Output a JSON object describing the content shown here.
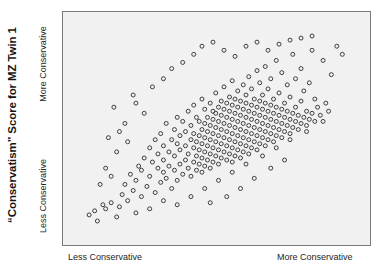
{
  "chart_data": {
    "type": "scatter",
    "title": "“Conservatism” Score for MZ Twin 1",
    "xlabel": "",
    "ylabel": "“Conservatism” Score for MZ Twin 1",
    "x_tick_labels": [
      "Less Conservative",
      "More Conservative"
    ],
    "y_tick_labels": [
      "Less Conservative",
      "More Conservative"
    ],
    "legend": [],
    "grid": false,
    "xlim": [
      0,
      100
    ],
    "ylim": [
      0,
      100
    ],
    "marker": "open-circle",
    "marker_color": "#3c3c3c",
    "marker_fill": "none",
    "marker_size": 4,
    "n_points": 312,
    "correlation_note": "strong positive correlation",
    "points": [
      [
        3,
        7
      ],
      [
        5,
        9
      ],
      [
        6,
        4
      ],
      [
        8,
        12
      ],
      [
        9,
        10
      ],
      [
        11,
        13
      ],
      [
        13,
        6
      ],
      [
        14,
        11
      ],
      [
        15,
        17
      ],
      [
        16,
        22
      ],
      [
        17,
        14
      ],
      [
        18,
        27
      ],
      [
        19,
        19
      ],
      [
        20,
        24
      ],
      [
        21,
        31
      ],
      [
        22,
        16
      ],
      [
        22,
        29
      ],
      [
        23,
        35
      ],
      [
        24,
        21
      ],
      [
        25,
        26
      ],
      [
        25,
        40
      ],
      [
        26,
        33
      ],
      [
        27,
        18
      ],
      [
        27,
        44
      ],
      [
        28,
        30
      ],
      [
        28,
        37
      ],
      [
        29,
        23
      ],
      [
        29,
        47
      ],
      [
        30,
        28
      ],
      [
        30,
        34
      ],
      [
        30,
        41
      ],
      [
        31,
        25
      ],
      [
        31,
        52
      ],
      [
        32,
        31
      ],
      [
        32,
        38
      ],
      [
        33,
        20
      ],
      [
        33,
        44
      ],
      [
        34,
        29
      ],
      [
        34,
        36
      ],
      [
        34,
        49
      ],
      [
        35,
        24
      ],
      [
        35,
        42
      ],
      [
        35,
        55
      ],
      [
        36,
        32
      ],
      [
        36,
        39
      ],
      [
        36,
        46
      ],
      [
        37,
        27
      ],
      [
        37,
        53
      ],
      [
        38,
        34
      ],
      [
        38,
        41
      ],
      [
        38,
        48
      ],
      [
        39,
        30
      ],
      [
        39,
        37
      ],
      [
        39,
        58
      ],
      [
        40,
        26
      ],
      [
        40,
        44
      ],
      [
        40,
        51
      ],
      [
        41,
        33
      ],
      [
        41,
        40
      ],
      [
        41,
        47
      ],
      [
        41,
        61
      ],
      [
        42,
        29
      ],
      [
        42,
        36
      ],
      [
        42,
        43
      ],
      [
        42,
        55
      ],
      [
        43,
        32
      ],
      [
        43,
        39
      ],
      [
        43,
        46
      ],
      [
        43,
        53
      ],
      [
        44,
        28
      ],
      [
        44,
        35
      ],
      [
        44,
        42
      ],
      [
        44,
        49
      ],
      [
        44,
        64
      ],
      [
        45,
        31
      ],
      [
        45,
        38
      ],
      [
        45,
        45
      ],
      [
        45,
        52
      ],
      [
        45,
        59
      ],
      [
        46,
        34
      ],
      [
        46,
        41
      ],
      [
        46,
        48
      ],
      [
        46,
        55
      ],
      [
        47,
        30
      ],
      [
        47,
        37
      ],
      [
        47,
        44
      ],
      [
        47,
        51
      ],
      [
        47,
        62
      ],
      [
        48,
        33
      ],
      [
        48,
        40
      ],
      [
        48,
        47
      ],
      [
        48,
        54
      ],
      [
        48,
        58
      ],
      [
        49,
        36
      ],
      [
        49,
        43
      ],
      [
        49,
        50
      ],
      [
        49,
        57
      ],
      [
        49,
        67
      ],
      [
        50,
        32
      ],
      [
        50,
        39
      ],
      [
        50,
        46
      ],
      [
        50,
        53
      ],
      [
        50,
        60
      ],
      [
        51,
        35
      ],
      [
        51,
        42
      ],
      [
        51,
        49
      ],
      [
        51,
        56
      ],
      [
        51,
        63
      ],
      [
        52,
        38
      ],
      [
        52,
        45
      ],
      [
        52,
        52
      ],
      [
        52,
        59
      ],
      [
        52,
        70
      ],
      [
        53,
        34
      ],
      [
        53,
        41
      ],
      [
        53,
        48
      ],
      [
        53,
        55
      ],
      [
        53,
        62
      ],
      [
        54,
        37
      ],
      [
        54,
        44
      ],
      [
        54,
        51
      ],
      [
        54,
        58
      ],
      [
        54,
        65
      ],
      [
        55,
        33
      ],
      [
        55,
        40
      ],
      [
        55,
        47
      ],
      [
        55,
        54
      ],
      [
        55,
        61
      ],
      [
        55,
        73
      ],
      [
        56,
        36
      ],
      [
        56,
        43
      ],
      [
        56,
        50
      ],
      [
        56,
        57
      ],
      [
        56,
        64
      ],
      [
        57,
        39
      ],
      [
        57,
        46
      ],
      [
        57,
        53
      ],
      [
        57,
        60
      ],
      [
        57,
        68
      ],
      [
        58,
        35
      ],
      [
        58,
        42
      ],
      [
        58,
        49
      ],
      [
        58,
        56
      ],
      [
        58,
        63
      ],
      [
        59,
        38
      ],
      [
        59,
        45
      ],
      [
        59,
        52
      ],
      [
        59,
        59
      ],
      [
        59,
        71
      ],
      [
        60,
        41
      ],
      [
        60,
        48
      ],
      [
        60,
        55
      ],
      [
        60,
        62
      ],
      [
        60,
        66
      ],
      [
        61,
        37
      ],
      [
        61,
        44
      ],
      [
        61,
        51
      ],
      [
        61,
        58
      ],
      [
        61,
        75
      ],
      [
        62,
        40
      ],
      [
        62,
        47
      ],
      [
        62,
        54
      ],
      [
        62,
        61
      ],
      [
        62,
        69
      ],
      [
        63,
        43
      ],
      [
        63,
        50
      ],
      [
        63,
        57
      ],
      [
        63,
        64
      ],
      [
        64,
        39
      ],
      [
        64,
        46
      ],
      [
        64,
        53
      ],
      [
        64,
        60
      ],
      [
        64,
        78
      ],
      [
        65,
        42
      ],
      [
        65,
        49
      ],
      [
        65,
        56
      ],
      [
        65,
        63
      ],
      [
        65,
        72
      ],
      [
        66,
        45
      ],
      [
        66,
        52
      ],
      [
        66,
        59
      ],
      [
        66,
        66
      ],
      [
        67,
        41
      ],
      [
        67,
        48
      ],
      [
        67,
        55
      ],
      [
        67,
        62
      ],
      [
        67,
        80
      ],
      [
        68,
        44
      ],
      [
        68,
        51
      ],
      [
        68,
        58
      ],
      [
        68,
        69
      ],
      [
        69,
        47
      ],
      [
        69,
        54
      ],
      [
        69,
        61
      ],
      [
        69,
        74
      ],
      [
        70,
        43
      ],
      [
        70,
        50
      ],
      [
        70,
        57
      ],
      [
        70,
        64
      ],
      [
        71,
        46
      ],
      [
        71,
        53
      ],
      [
        71,
        60
      ],
      [
        71,
        83
      ],
      [
        72,
        49
      ],
      [
        72,
        56
      ],
      [
        72,
        67
      ],
      [
        73,
        45
      ],
      [
        73,
        52
      ],
      [
        73,
        59
      ],
      [
        73,
        77
      ],
      [
        74,
        48
      ],
      [
        74,
        55
      ],
      [
        74,
        62
      ],
      [
        75,
        51
      ],
      [
        75,
        58
      ],
      [
        75,
        71
      ],
      [
        76,
        47
      ],
      [
        76,
        54
      ],
      [
        76,
        65
      ],
      [
        77,
        50
      ],
      [
        77,
        57
      ],
      [
        77,
        86
      ],
      [
        78,
        53
      ],
      [
        78,
        60
      ],
      [
        78,
        74
      ],
      [
        79,
        49
      ],
      [
        79,
        56
      ],
      [
        80,
        52
      ],
      [
        80,
        63
      ],
      [
        80,
        79
      ],
      [
        81,
        55
      ],
      [
        81,
        68
      ],
      [
        82,
        51
      ],
      [
        82,
        58
      ],
      [
        83,
        54
      ],
      [
        83,
        72
      ],
      [
        84,
        57
      ],
      [
        84,
        88
      ],
      [
        85,
        53
      ],
      [
        85,
        64
      ],
      [
        86,
        60
      ],
      [
        87,
        56
      ],
      [
        88,
        83
      ],
      [
        89,
        62
      ],
      [
        90,
        58
      ],
      [
        91,
        76
      ],
      [
        93,
        90
      ],
      [
        95,
        86
      ],
      [
        12,
        60
      ],
      [
        16,
        52
      ],
      [
        19,
        66
      ],
      [
        23,
        57
      ],
      [
        10,
        45
      ],
      [
        13,
        38
      ],
      [
        9,
        30
      ],
      [
        7,
        22
      ],
      [
        11,
        26
      ],
      [
        14,
        48
      ],
      [
        17,
        43
      ],
      [
        20,
        62
      ],
      [
        26,
        70
      ],
      [
        30,
        74
      ],
      [
        33,
        79
      ],
      [
        37,
        82
      ],
      [
        41,
        86
      ],
      [
        44,
        90
      ],
      [
        48,
        92
      ],
      [
        52,
        88
      ],
      [
        56,
        85
      ],
      [
        60,
        90
      ],
      [
        64,
        92
      ],
      [
        68,
        88
      ],
      [
        72,
        91
      ],
      [
        76,
        93
      ],
      [
        80,
        94
      ],
      [
        84,
        95
      ],
      [
        35,
        12
      ],
      [
        40,
        16
      ],
      [
        45,
        20
      ],
      [
        50,
        24
      ],
      [
        55,
        28
      ],
      [
        60,
        32
      ],
      [
        66,
        36
      ],
      [
        71,
        40
      ],
      [
        76,
        44
      ],
      [
        82,
        48
      ],
      [
        88,
        53
      ],
      [
        25,
        10
      ],
      [
        30,
        14
      ],
      [
        20,
        8
      ],
      [
        63,
        25
      ],
      [
        69,
        30
      ],
      [
        74,
        34
      ],
      [
        58,
        20
      ],
      [
        53,
        16
      ],
      [
        47,
        13
      ]
    ]
  },
  "axis": {
    "x_left_label": "Less Conservative",
    "x_right_label": "More Conservative",
    "y_bottom_label": "Less Conservative",
    "y_top_label": "More Conservative"
  },
  "style": {
    "plot_background": "#f1f1f1",
    "frame_color": "#7b7b7b",
    "text_color": "#242424",
    "title_color": "#141414"
  }
}
